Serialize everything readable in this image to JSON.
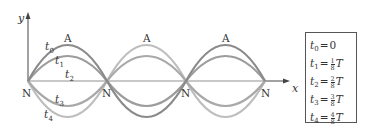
{
  "axes": {
    "y_label": "y",
    "x_label": "x"
  },
  "node_label": "N",
  "antinode_label": "A",
  "curve_labels": [
    "t0",
    "t1",
    "t2",
    "t3",
    "t4"
  ],
  "legend": [
    {
      "var": "t",
      "sub": "0",
      "value": "0",
      "num": "",
      "den": "",
      "unit": ""
    },
    {
      "var": "t",
      "sub": "1",
      "value": "",
      "num": "1",
      "den": "8",
      "unit": "T"
    },
    {
      "var": "t",
      "sub": "2",
      "value": "",
      "num": "2",
      "den": "8",
      "unit": "T"
    },
    {
      "var": "t",
      "sub": "3",
      "value": "",
      "num": "3",
      "den": "8",
      "unit": "T"
    },
    {
      "var": "t",
      "sub": "4",
      "value": "",
      "num": "4",
      "den": "8",
      "unit": "T"
    }
  ],
  "colors": {
    "t0": "#8a8a8a",
    "t1": "#9a9a9a",
    "t2": "#c4c4c4",
    "t3": "#a4a4a4",
    "t4": "#bdbdbd",
    "axis": "#444444"
  }
}
